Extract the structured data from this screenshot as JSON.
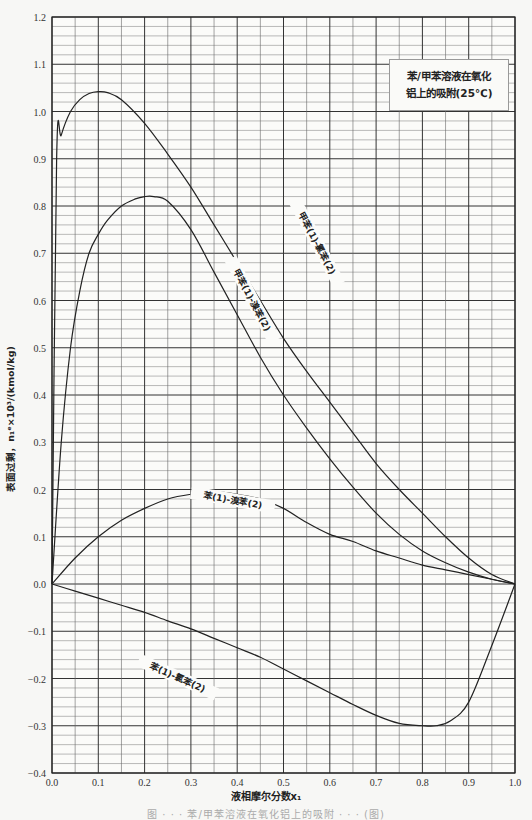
{
  "chart_data": {
    "type": "line",
    "title_lines": [
      "苯/甲苯溶液在氧化",
      "铝上的吸附(25℃)"
    ],
    "xlabel": "液相摩尔分数x₁",
    "ylabel": "表面过剩，n₁ᵉ×10³/(kmol/kg)",
    "xlim": [
      0.0,
      1.0
    ],
    "ylim": [
      -0.4,
      1.2
    ],
    "grid": true,
    "x_ticks": [
      "0.0",
      "0.1",
      "0.2",
      "0.3",
      "0.4",
      "0.5",
      "0.6",
      "0.7",
      "0.8",
      "0.9",
      "1.0"
    ],
    "y_ticks": [
      "1.2",
      "1.1",
      "1.0",
      "0.9",
      "0.8",
      "0.7",
      "0.6",
      "0.5",
      "0.4",
      "0.3",
      "0.2",
      "0.1",
      "0.0",
      "-0.1",
      "-0.2",
      "-0.3",
      "-0.4"
    ],
    "series": [
      {
        "name": "甲苯(1)-氯苯(2)",
        "x": [
          0.0,
          0.01,
          0.02,
          0.04,
          0.06,
          0.08,
          0.1,
          0.12,
          0.15,
          0.2,
          0.25,
          0.3,
          0.35,
          0.4,
          0.45,
          0.5,
          0.55,
          0.6,
          0.65,
          0.7,
          0.75,
          0.8,
          0.85,
          0.9,
          0.95,
          1.0
        ],
        "values": [
          0.0,
          0.9,
          0.95,
          1.0,
          1.025,
          1.038,
          1.042,
          1.04,
          1.025,
          0.975,
          0.91,
          0.84,
          0.76,
          0.68,
          0.6,
          0.52,
          0.45,
          0.385,
          0.32,
          0.255,
          0.2,
          0.15,
          0.1,
          0.055,
          0.02,
          0.0
        ]
      },
      {
        "name": "甲苯(1)-溴苯(2)",
        "x": [
          0.0,
          0.02,
          0.04,
          0.06,
          0.08,
          0.1,
          0.12,
          0.15,
          0.18,
          0.2,
          0.22,
          0.25,
          0.3,
          0.35,
          0.4,
          0.45,
          0.5,
          0.55,
          0.6,
          0.65,
          0.7,
          0.75,
          0.8,
          0.85,
          0.9,
          0.95,
          1.0
        ],
        "values": [
          0.0,
          0.3,
          0.5,
          0.62,
          0.7,
          0.74,
          0.77,
          0.8,
          0.815,
          0.82,
          0.82,
          0.81,
          0.75,
          0.66,
          0.57,
          0.48,
          0.4,
          0.33,
          0.265,
          0.205,
          0.15,
          0.105,
          0.07,
          0.045,
          0.025,
          0.01,
          0.0
        ]
      },
      {
        "name": "苯(1)-溴苯(2)",
        "x": [
          0.0,
          0.05,
          0.1,
          0.15,
          0.2,
          0.25,
          0.3,
          0.35,
          0.4,
          0.45,
          0.5,
          0.55,
          0.6,
          0.65,
          0.7,
          0.75,
          0.8,
          0.85,
          0.9,
          0.95,
          1.0
        ],
        "values": [
          0.0,
          0.055,
          0.1,
          0.135,
          0.16,
          0.18,
          0.19,
          0.195,
          0.19,
          0.18,
          0.16,
          0.13,
          0.105,
          0.09,
          0.07,
          0.055,
          0.04,
          0.03,
          0.02,
          0.01,
          0.0
        ]
      },
      {
        "name": "苯(1)-氯苯(2)",
        "x": [
          0.0,
          0.05,
          0.1,
          0.15,
          0.2,
          0.25,
          0.3,
          0.35,
          0.4,
          0.45,
          0.5,
          0.55,
          0.6,
          0.65,
          0.7,
          0.75,
          0.8,
          0.83,
          0.86,
          0.9,
          0.95,
          1.0
        ],
        "values": [
          0.0,
          -0.015,
          -0.03,
          -0.045,
          -0.06,
          -0.078,
          -0.095,
          -0.115,
          -0.135,
          -0.155,
          -0.18,
          -0.205,
          -0.23,
          -0.255,
          -0.278,
          -0.295,
          -0.3,
          -0.3,
          -0.29,
          -0.25,
          -0.13,
          0.0
        ]
      }
    ],
    "annotations": [
      {
        "text": "甲苯(1)-氯苯(2)",
        "x": 0.57,
        "y": 0.72,
        "rotation": 62
      },
      {
        "text": "甲苯(1)-溴苯(2)",
        "x": 0.43,
        "y": 0.6,
        "rotation": 62
      },
      {
        "text": "苯(1)-溴苯(2)",
        "x": 0.39,
        "y": 0.175,
        "rotation": 10
      },
      {
        "text": "苯(1)-氯苯(2)",
        "x": 0.27,
        "y": -0.2,
        "rotation": 24
      }
    ]
  },
  "labels": {
    "xlabel": "液相摩尔分数x₁",
    "ylabel": "表面过剩，n₁ᵉ×10³/(kmol/kg)",
    "legend_line1": "苯/甲苯溶液在氧化",
    "legend_line2": "铝上的吸附(25℃)",
    "caption": "图 · · · 苯/甲苯溶液在氧化铝上的吸附 · · · (图)"
  }
}
